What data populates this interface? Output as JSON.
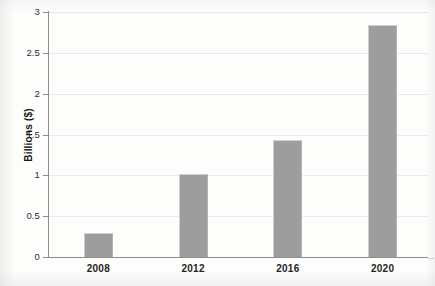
{
  "chart_data": {
    "type": "bar",
    "title": "",
    "subtitle": "",
    "xlabel": "",
    "ylabel": "Billions ($)",
    "categories": [
      "2008",
      "2012",
      "2016",
      "2020"
    ],
    "values": [
      0.3,
      1.02,
      1.43,
      2.84
    ],
    "series": [
      {
        "name": "Revenue",
        "values": [
          0.3,
          1.02,
          1.43,
          2.84
        ]
      }
    ],
    "ylim": [
      0,
      3
    ],
    "ytick_labels": [
      "0",
      "0.5",
      "1",
      "1.5",
      "2",
      "2.5",
      "3"
    ],
    "ytick_values": [
      0,
      0.5,
      1,
      1.5,
      2,
      2.5,
      3
    ],
    "grid": "horizontal",
    "legend": "none",
    "bar_color": "#9d9d9d",
    "gridline_color": "#eceaea",
    "axis_color": "#8e8e8e",
    "background_color": "#fdfdfc"
  },
  "axes": {
    "y_title": "Billions ($)",
    "y_ticks": [
      {
        "label": "3",
        "value": 3
      },
      {
        "label": "2.5",
        "value": 2.5
      },
      {
        "label": "2",
        "value": 2
      },
      {
        "label": "1.5",
        "value": 1.5
      },
      {
        "label": "1",
        "value": 1
      },
      {
        "label": "0.5",
        "value": 0.5
      },
      {
        "label": "0",
        "value": 0
      }
    ],
    "x_ticks": [
      {
        "label": "2008"
      },
      {
        "label": "2012"
      },
      {
        "label": "2016"
      },
      {
        "label": "2020"
      }
    ]
  },
  "bars": [
    {
      "category": "2008",
      "value": 0.3
    },
    {
      "category": "2012",
      "value": 1.02
    },
    {
      "category": "2016",
      "value": 1.43
    },
    {
      "category": "2020",
      "value": 2.84
    }
  ]
}
